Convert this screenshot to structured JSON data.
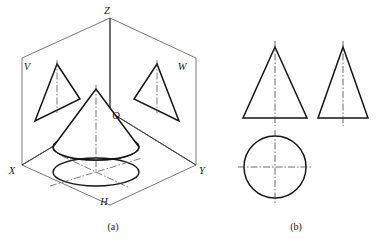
{
  "figure": {
    "captions": [
      {
        "id": "caption-a",
        "text": "(a)",
        "x": 113,
        "y": 228
      },
      {
        "id": "caption-b",
        "text": "(b)",
        "x": 296,
        "y": 228
      }
    ]
  },
  "pictorial": {
    "name": "three-plane-projection-box",
    "labels": [
      {
        "id": "axis-label-z",
        "text": "Z",
        "x": 107,
        "y": 14
      },
      {
        "id": "plane-label-v",
        "text": "V",
        "x": 27,
        "y": 70
      },
      {
        "id": "plane-label-w",
        "text": "W",
        "x": 182,
        "y": 70
      },
      {
        "id": "axis-label-x",
        "text": "X",
        "x": 12,
        "y": 174
      },
      {
        "id": "axis-label-y",
        "text": "Y",
        "x": 200,
        "y": 174
      },
      {
        "id": "plane-label-h",
        "text": "H",
        "x": 104,
        "y": 205
      },
      {
        "id": "origin-label-o",
        "text": "O",
        "x": 114,
        "y": 118
      }
    ],
    "planes": {
      "v_plane_points": "22,58 110,18 110,112 22,165",
      "w_plane_points": "110,18 196,58 196,165 110,112",
      "h_plane_points": "22,165 110,112 196,165 110,205"
    },
    "axes": {
      "z_axis": {
        "x1": 110,
        "y1": 18,
        "x2": 110,
        "y2": 112
      },
      "x_axis": {
        "x1": 22,
        "y1": 165,
        "x2": 110,
        "y2": 112
      },
      "y_axis": {
        "x1": 196,
        "y1": 165,
        "x2": 110,
        "y2": 112
      }
    },
    "v_projection_triangle": {
      "apex": {
        "x": 57,
        "y": 64
      },
      "base_left": {
        "x": 35,
        "y": 121
      },
      "base_right": {
        "x": 80,
        "y": 99
      },
      "centerline": {
        "x1": 57,
        "y1": 60,
        "x2": 57,
        "y2": 113
      }
    },
    "w_projection_triangle": {
      "apex": {
        "x": 157,
        "y": 64
      },
      "base_left": {
        "x": 134,
        "y": 99
      },
      "base_right": {
        "x": 179,
        "y": 121
      },
      "centerline": {
        "x1": 157,
        "y1": 60,
        "x2": 157,
        "y2": 113
      }
    },
    "cone": {
      "apex": {
        "x": 96,
        "y": 89
      },
      "base_center": {
        "x": 96,
        "y": 147
      },
      "base_rx": 43,
      "base_ry": 13,
      "axis_centerline": {
        "x1": 96,
        "y1": 85,
        "x2": 96,
        "y2": 170
      }
    },
    "h_projection_circle": {
      "center": {
        "x": 96,
        "y": 172
      },
      "rx": 43,
      "ry": 14,
      "centerline_major": {
        "x1": 50,
        "y1": 186,
        "x2": 142,
        "y2": 158
      },
      "centerline_minor": {
        "x1": 62,
        "y1": 156,
        "x2": 130,
        "y2": 188
      }
    }
  },
  "orthographic": {
    "name": "three-view-drawing",
    "front_view": {
      "label": "front-view-triangle",
      "apex": {
        "x": 275,
        "y": 47
      },
      "base_left": {
        "x": 243,
        "y": 118
      },
      "base_right": {
        "x": 307,
        "y": 118
      },
      "centerline": {
        "x1": 275,
        "y1": 41,
        "x2": 275,
        "y2": 126
      }
    },
    "side_view": {
      "label": "side-view-triangle",
      "apex": {
        "x": 343,
        "y": 47
      },
      "base_left": {
        "x": 318,
        "y": 118
      },
      "base_right": {
        "x": 368,
        "y": 118
      },
      "centerline": {
        "x1": 343,
        "y1": 41,
        "x2": 343,
        "y2": 126
      }
    },
    "top_view": {
      "label": "top-view-circle",
      "center": {
        "x": 275,
        "y": 167
      },
      "r": 31,
      "vertical_centerline": {
        "x1": 275,
        "y1": 130,
        "x2": 275,
        "y2": 204
      },
      "horizontal_centerline": {
        "x1": 238,
        "y1": 167,
        "x2": 312,
        "y2": 167
      }
    }
  },
  "style": {
    "outline_color": "#1a1a1a",
    "thin_color": "#3c3c3c",
    "center_color": "#444444",
    "background": "#ffffff",
    "outline_width": 1.5,
    "thin_width": 0.7,
    "center_width": 0.7,
    "center_dash": "7 2 1.5 2"
  }
}
